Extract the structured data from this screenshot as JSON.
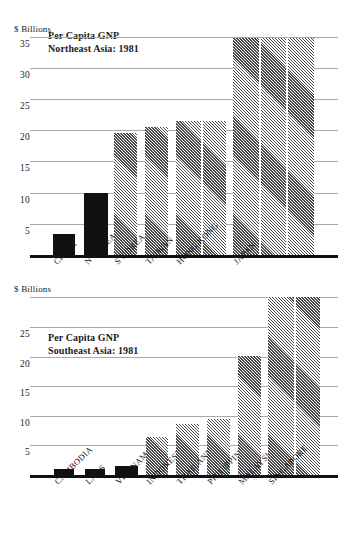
{
  "chart_data": [
    {
      "type": "bar",
      "title": "Per Capita GNP",
      "subtitle": "Northeast Asia: 1981",
      "ylabel": "$ Billions",
      "xlabel": "",
      "ylim": [
        0,
        35
      ],
      "yticks": [
        5,
        10,
        15,
        20,
        25,
        30,
        35
      ],
      "ytick_labels": [
        "5",
        "10",
        "15",
        "20",
        "25",
        "30",
        "35"
      ],
      "grid": true,
      "legend": "none",
      "categories": [
        "CHINA",
        "N KOREA",
        "S KOREA",
        "TAIWAN",
        "HONG KONG",
        "JAPAN"
      ],
      "values": [
        3.3,
        10.0,
        19.5,
        20.5,
        21.5,
        34.7
      ],
      "bars": [
        {
          "label": "CHINA",
          "value": 3.3,
          "fill": "solid",
          "segments": 1
        },
        {
          "label": "N KOREA",
          "value": 10.0,
          "fill": "solid",
          "segments": 1
        },
        {
          "label": "S KOREA",
          "value": 19.5,
          "fill": "hatch",
          "segments": 1
        },
        {
          "label": "TAIWAN",
          "value": 20.5,
          "fill": "hatch",
          "segments": 1
        },
        {
          "label": "HONG KONG",
          "value": 21.5,
          "fill": "hatch",
          "segments": 2
        },
        {
          "label": "JAPAN",
          "value": 34.7,
          "fill": "hatch",
          "segments": 3
        }
      ]
    },
    {
      "type": "bar",
      "title": "Per Capita GNP",
      "subtitle": "Southeast Asia: 1981",
      "ylabel": "$ Billions",
      "xlabel": "",
      "ylim": [
        0,
        30
      ],
      "yticks": [
        5,
        10,
        15,
        20,
        25,
        30
      ],
      "ytick_labels": [
        "5",
        "10",
        "15",
        "20",
        "25",
        ""
      ],
      "grid": true,
      "legend": "none",
      "categories": [
        "CAMBODIA",
        "LAOS",
        "VIETNAM",
        "INDONESIA",
        "THAILAND",
        "PHILIPPINES",
        "MALAYSIA",
        "SINGAPORE"
      ],
      "values": [
        1.0,
        1.0,
        1.6,
        6.5,
        8.6,
        9.5,
        20.1,
        30.0
      ],
      "bars": [
        {
          "label": "CAMBODIA",
          "value": 1.0,
          "fill": "solid",
          "segments": 1
        },
        {
          "label": "LAOS",
          "value": 1.0,
          "fill": "solid",
          "segments": 1
        },
        {
          "label": "VIETNAM",
          "value": 1.6,
          "fill": "solid",
          "segments": 1
        },
        {
          "label": "INDONESIA",
          "value": 6.5,
          "fill": "hatch",
          "segments": 1
        },
        {
          "label": "THAILAND",
          "value": 8.6,
          "fill": "hatch",
          "segments": 1
        },
        {
          "label": "PHILIPPINES",
          "value": 9.5,
          "fill": "hatch",
          "segments": 1
        },
        {
          "label": "MALAYSIA",
          "value": 20.1,
          "fill": "hatch",
          "segments": 1
        },
        {
          "label": "SINGAPORE",
          "value": 30.0,
          "fill": "hatch",
          "segments": 2
        }
      ]
    }
  ],
  "colors": {
    "solid_bar": "#111111",
    "hatch_bar": "#4a4a4a",
    "gridline": "#a9a9a9",
    "axis": "#111111",
    "text": "#1a1a1a",
    "background": "#ffffff"
  },
  "geometry": {
    "top": {
      "baseline_y": 255,
      "px_per_unit": 6.24,
      "plot_left": 30,
      "plot_right": 338,
      "bars": [
        {
          "x": 53,
          "w": 22,
          "gaps": []
        },
        {
          "x": 84,
          "w": 24,
          "gaps": []
        },
        {
          "x": 114,
          "w": 23,
          "gaps": []
        },
        {
          "x": 145,
          "w": 23,
          "gaps": []
        },
        {
          "x": 176,
          "w": 50,
          "gaps": [
            25
          ]
        },
        {
          "x": 233,
          "w": 81,
          "gaps": [
            26,
            53
          ]
        }
      ]
    },
    "bottom": {
      "baseline_y": 475,
      "px_per_unit": 5.92,
      "plot_left": 30,
      "plot_right": 338,
      "bars": [
        {
          "x": 54,
          "w": 20,
          "gaps": []
        },
        {
          "x": 85,
          "w": 20,
          "gaps": []
        },
        {
          "x": 115,
          "w": 23,
          "gaps": []
        },
        {
          "x": 146,
          "w": 22,
          "gaps": []
        },
        {
          "x": 176,
          "w": 23,
          "gaps": []
        },
        {
          "x": 207,
          "w": 23,
          "gaps": []
        },
        {
          "x": 238,
          "w": 23,
          "gaps": []
        },
        {
          "x": 268,
          "w": 52,
          "gaps": [
            26
          ]
        }
      ]
    }
  }
}
